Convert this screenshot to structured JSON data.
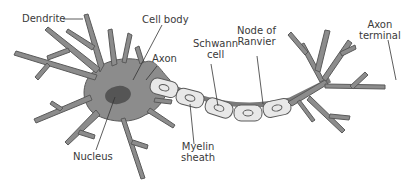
{
  "diagram": {
    "colors": {
      "neuron_fill": "#8c8c8c",
      "neuron_outline": "#5a5a5a",
      "nucleus": "#555555",
      "myelin_fill": "#e8e8e8",
      "node": "#7a7a7a",
      "label_text": "#3a3a3a",
      "leader_line": "#333333"
    },
    "labels": {
      "dendrite": "Dendrite",
      "cell_body": "Cell body",
      "axon": "Axon",
      "schwann_line1": "Schwann",
      "schwann_line2": "cell",
      "node_line1": "Node of",
      "node_line2": "Ranvier",
      "terminal_line1": "Axon",
      "terminal_line2": "terminal",
      "nucleus": "Nucleus",
      "myelin_line1": "Myelin",
      "myelin_line2": "sheath"
    }
  }
}
